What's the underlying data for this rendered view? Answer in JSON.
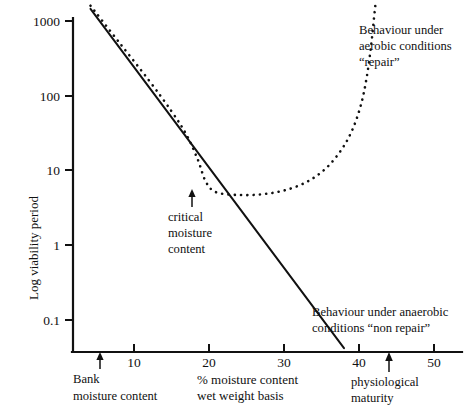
{
  "chart_data": {
    "type": "line",
    "title": "",
    "subtitle": "",
    "xlabel": "% moisture content wet weight basis",
    "ylabel": "Log viability period",
    "xlim": [
      0,
      55
    ],
    "ylim": [
      0.03,
      2000
    ],
    "yscale": "log",
    "grid": false,
    "legend_position": "inline-annotations",
    "xticks": [
      {
        "value": 10,
        "label": "10"
      },
      {
        "value": 20,
        "label": "20"
      },
      {
        "value": 30,
        "label": "30"
      },
      {
        "value": 40,
        "label": "40"
      },
      {
        "value": 50,
        "label": "50"
      }
    ],
    "yticks": [
      {
        "value": 1000,
        "label": "1000"
      },
      {
        "value": 100,
        "label": "100"
      },
      {
        "value": 10,
        "label": "10"
      },
      {
        "value": 1,
        "label": "1"
      },
      {
        "value": 0.1,
        "label": "0.1"
      }
    ],
    "series": [
      {
        "name": "Behaviour under anaerobic conditions \"non repair\"",
        "style": "solid",
        "points": [
          {
            "x": 4.2,
            "y": 1450
          },
          {
            "x": 10,
            "y": 200
          },
          {
            "x": 15,
            "y": 43
          },
          {
            "x": 18.5,
            "y": 15
          },
          {
            "x": 20,
            "y": 9.5
          },
          {
            "x": 25,
            "y": 2.1
          },
          {
            "x": 30,
            "y": 0.46
          },
          {
            "x": 34.5,
            "y": 0.115
          },
          {
            "x": 38.0,
            "y": 0.042
          }
        ]
      },
      {
        "name": "Behaviour under aerobic conditions \"repair\"",
        "style": "dotted",
        "points": [
          {
            "x": 4.2,
            "y": 1600
          },
          {
            "x": 8,
            "y": 520
          },
          {
            "x": 12,
            "y": 160
          },
          {
            "x": 15,
            "y": 62
          },
          {
            "x": 17,
            "y": 30
          },
          {
            "x": 18.5,
            "y": 14
          },
          {
            "x": 19.6,
            "y": 7.0
          },
          {
            "x": 21,
            "y": 5.1
          },
          {
            "x": 24,
            "y": 4.7
          },
          {
            "x": 27,
            "y": 4.8
          },
          {
            "x": 30,
            "y": 5.4
          },
          {
            "x": 33,
            "y": 7.0
          },
          {
            "x": 35.5,
            "y": 10.5
          },
          {
            "x": 37.5,
            "y": 18
          },
          {
            "x": 39,
            "y": 33
          },
          {
            "x": 40.2,
            "y": 72
          },
          {
            "x": 41.0,
            "y": 170
          },
          {
            "x": 41.6,
            "y": 460
          },
          {
            "x": 42.0,
            "y": 1100
          },
          {
            "x": 42.2,
            "y": 1700
          }
        ]
      }
    ],
    "annotations": [
      {
        "id": "aerobic",
        "lines": [
          "Behaviour under",
          "aerobic conditions",
          "“repair”"
        ]
      },
      {
        "id": "anaerobic",
        "lines": [
          "Behaviour under anaerobic",
          "conditions “non repair”"
        ]
      },
      {
        "id": "critical",
        "lines": [
          "critical",
          "moisture",
          "content"
        ],
        "arrow_x": 18.5
      },
      {
        "id": "bank",
        "lines": [
          "Bank",
          "moisture content"
        ],
        "arrow_x": 4.8
      },
      {
        "id": "physiological",
        "lines": [
          "physiological",
          "maturity"
        ],
        "arrow_x": 44.0
      }
    ]
  },
  "axis": {
    "ylabel": "Log viability period",
    "xlabel_line1": "% moisture content",
    "xlabel_line2": "wet weight basis"
  },
  "yticks": {
    "t1000": "1000",
    "t100": "100",
    "t10": "10",
    "t1": "1",
    "t01": "0.1"
  },
  "xticks": {
    "t10": "10",
    "t20": "20",
    "t30": "30",
    "t40": "40",
    "t50": "50"
  },
  "annotations": {
    "aerobic_l1": "Behaviour under",
    "aerobic_l2": "aerobic conditions",
    "aerobic_l3": "“repair”",
    "anaerobic_l1": "Behaviour under anaerobic",
    "anaerobic_l2": "conditions “non repair”",
    "critical_l1": "critical",
    "critical_l2": "moisture",
    "critical_l3": "content",
    "bank_l1": "Bank",
    "bank_l2": "moisture content",
    "physio_l1": "physiological",
    "physio_l2": "maturity"
  }
}
